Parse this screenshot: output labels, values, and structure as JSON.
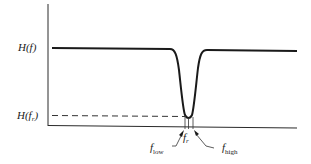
{
  "diagram": {
    "type": "notch-filter-frequency-response",
    "y_labels": {
      "passband": "H(f)",
      "notch": "H(fₑ)"
    },
    "y_label_parts": {
      "passband_main": "H(",
      "passband_var": "f",
      "passband_close": ")",
      "notch_main": "H(",
      "notch_var": "f",
      "notch_sub": "r",
      "notch_close": ")"
    },
    "x_labels": {
      "center_var": "f",
      "center_sub": "r",
      "low_var": "f",
      "low_sub": "low",
      "high_var": "f",
      "high_sub": "high"
    },
    "colors": {
      "curve": "#1a1a1a",
      "axes": "#2a2a2a",
      "dashed": "#333333"
    }
  }
}
